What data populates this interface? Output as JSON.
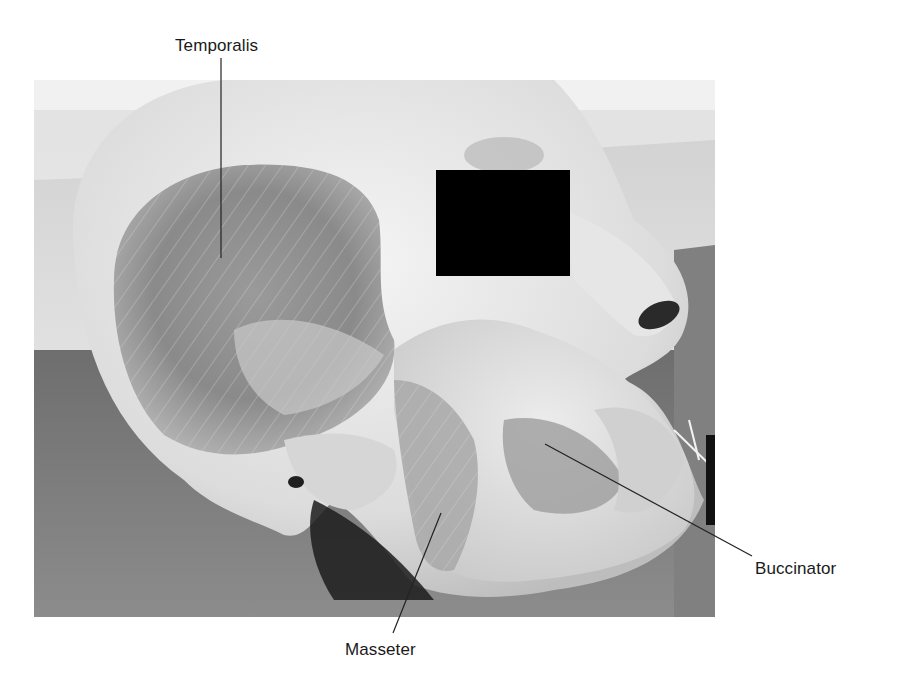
{
  "figure": {
    "type": "anatomical-photograph",
    "redaction_box": {
      "color": "#000000",
      "x": 436,
      "y": 170,
      "width": 134,
      "height": 106
    }
  },
  "labels": [
    {
      "id": "temporalis",
      "text": "Temporalis",
      "x": 175,
      "y": 37,
      "leader": {
        "x1": 221,
        "y1": 58,
        "x2": 221,
        "y2": 258
      }
    },
    {
      "id": "masseter",
      "text": "Masseter",
      "x": 345,
      "y": 641,
      "leader": {
        "x1": 441,
        "y1": 513,
        "x2": 393,
        "y2": 633
      }
    },
    {
      "id": "buccinator",
      "text": "Buccinator",
      "x": 755,
      "y": 560,
      "leader": {
        "x1": 545,
        "y1": 444,
        "x2": 752,
        "y2": 556
      }
    }
  ],
  "colors": {
    "background": "#ffffff",
    "label_text": "#1a1a1a",
    "leader_line": "#222222",
    "table_surface": "#7d7d7d",
    "tissue_light": "#e4e4e4",
    "muscle_dark": "#8c8c8c"
  }
}
